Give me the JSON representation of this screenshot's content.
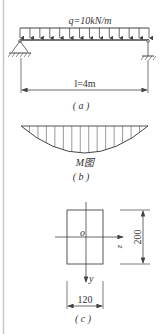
{
  "figure_a": {
    "load_label": "q=10kN/m",
    "span_label": "l=4m",
    "caption": "( a )",
    "load_arrow_count": 14
  },
  "figure_b": {
    "diagram_label": "M图",
    "caption": "( b )",
    "hatch_count": 15
  },
  "figure_c": {
    "origin_label": "o",
    "z_axis_label": "z",
    "y_axis_label": "y",
    "height_dim": "200",
    "width_dim": "120",
    "caption": "( c )"
  },
  "colors": {
    "line": "#444444",
    "text": "#333333",
    "border": "#c8c8c8"
  }
}
